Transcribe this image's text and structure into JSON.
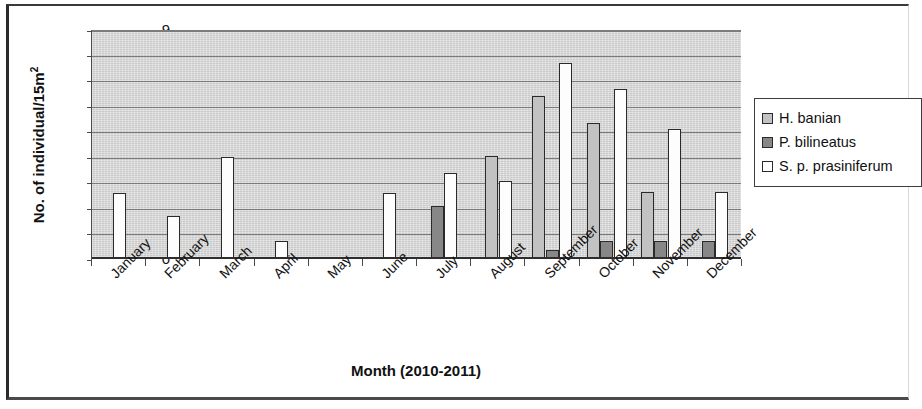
{
  "chart_data": {
    "type": "bar",
    "title": "",
    "xlabel": "Month (2010-2011)",
    "ylabel": "No. of individual/15m2",
    "ylabel_base": "No. of individual/15m",
    "ylabel_sup": "2",
    "ylim": [
      0,
      9
    ],
    "ytick_step": 1,
    "yticks": [
      "9",
      "8",
      "7",
      "6",
      "5",
      "4",
      "3",
      "2",
      "1",
      "0"
    ],
    "grid": true,
    "legend_position": "right",
    "categories": [
      "January",
      "February",
      "March",
      "April",
      "May",
      "June",
      "July",
      "August",
      "September",
      "October",
      "November",
      "December"
    ],
    "series": [
      {
        "name": "H. banian",
        "color": "#c2c2c2",
        "values": [
          0,
          0,
          0,
          0,
          0,
          0,
          0,
          4.05,
          6.4,
          5.35,
          2.65,
          0
        ]
      },
      {
        "name": "P. bilineatus",
        "color": "#878787",
        "values": [
          0,
          0,
          0,
          0,
          0,
          0,
          2.1,
          0,
          0.35,
          0.7,
          0.7,
          0.7
        ]
      },
      {
        "name": "S. p. prasiniferum",
        "color": "#ffffff",
        "values": [
          2.6,
          1.7,
          4.0,
          0.7,
          0,
          2.6,
          3.4,
          3.05,
          7.7,
          6.7,
          5.1,
          2.65
        ]
      }
    ]
  },
  "legend": {
    "items": [
      {
        "label": "H. banian",
        "swatch": "s-hbanian"
      },
      {
        "label": "P. bilineatus",
        "swatch": "s-pbilineatus"
      },
      {
        "label": "S. p. prasiniferum",
        "swatch": "s-sprasiniferum"
      }
    ]
  }
}
